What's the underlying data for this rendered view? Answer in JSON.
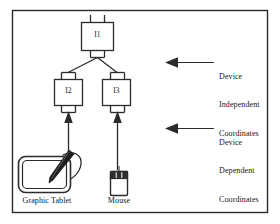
{
  "figure": {
    "background_color": "#ffffff",
    "line_color": "#2b2b2b",
    "text_color": "#161616",
    "border": {
      "name": "figure-border",
      "x": 12,
      "y": 10,
      "width": 256,
      "height": 203
    }
  },
  "nodes": [
    {
      "id": "I1",
      "label": "I1",
      "x": 81,
      "y": 22,
      "width": 33,
      "height": 29
    },
    {
      "id": "I2",
      "label": "I2",
      "x": 54,
      "y": 79,
      "width": 29,
      "height": 27
    },
    {
      "id": "I3",
      "label": "I3",
      "x": 102,
      "y": 79,
      "width": 29,
      "height": 27
    }
  ],
  "annotations": [
    {
      "name": "device-independent-annotation",
      "lines": [
        "Device",
        "Independent",
        "Coordinates"
      ],
      "text": "Device\nIndependent\nCoordinates",
      "arrow": {
        "from_x": 214,
        "to_x": 166,
        "y": 62,
        "direction": "left"
      },
      "text_x": 219,
      "text_y": 54
    },
    {
      "name": "device-dependent-annotation",
      "lines": [
        "Device",
        "Dependent",
        "Coordinates"
      ],
      "text": "Device\nDependent\nCoordinates",
      "arrow": {
        "from_x": 214,
        "to_x": 166,
        "y": 128,
        "direction": "left"
      },
      "text_x": 219,
      "text_y": 120
    }
  ],
  "devices": [
    {
      "name": "graphic-tablet",
      "label": "Graphic Tablet",
      "label_x": 22,
      "label_y": 197,
      "icon": "graphic-tablet-icon",
      "arrow": {
        "x": 68,
        "from_y": 164,
        "to_y": 112,
        "direction": "up"
      }
    },
    {
      "name": "mouse",
      "label": "Mouse",
      "label_x": 105,
      "label_y": 196,
      "icon": "mouse-icon",
      "arrow": {
        "x": 117,
        "from_y": 170,
        "to_y": 112,
        "direction": "up"
      }
    }
  ],
  "connections": [
    {
      "from": "I1",
      "to": "I2",
      "type": "branch"
    },
    {
      "from": "I1",
      "to": "I3",
      "type": "branch"
    }
  ]
}
